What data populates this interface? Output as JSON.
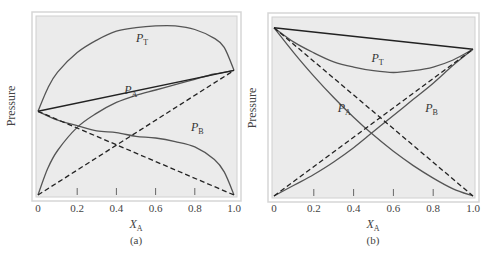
{
  "chart_data": [
    {
      "type": "line",
      "panel": "(a)",
      "title": "",
      "xlabel": "X_A",
      "ylabel": "Pressure",
      "xlim": [
        0,
        1.0
      ],
      "ylim": [
        0,
        1.0
      ],
      "x_ticks": [
        "0",
        "0.2",
        "0.4",
        "0.6",
        "0.8",
        "1.0"
      ],
      "y_ticks": [],
      "grid": false,
      "legend": "inline curve labels",
      "series": [
        {
          "name": "P_T",
          "style": "solid",
          "x": [
            0,
            0.05,
            0.1,
            0.2,
            0.3,
            0.4,
            0.5,
            0.6,
            0.7,
            0.8,
            0.9,
            0.95,
            1.0
          ],
          "values": [
            0.47,
            0.6,
            0.69,
            0.8,
            0.87,
            0.92,
            0.94,
            0.95,
            0.95,
            0.93,
            0.88,
            0.83,
            0.7
          ]
        },
        {
          "name": "P_A",
          "style": "solid",
          "x": [
            0,
            0.05,
            0.1,
            0.2,
            0.3,
            0.4,
            0.5,
            0.6,
            0.7,
            0.8,
            0.9,
            1.0
          ],
          "values": [
            0,
            0.15,
            0.25,
            0.38,
            0.46,
            0.52,
            0.56,
            0.59,
            0.62,
            0.65,
            0.68,
            0.7
          ]
        },
        {
          "name": "P_B",
          "style": "solid",
          "x": [
            0,
            0.1,
            0.2,
            0.3,
            0.4,
            0.5,
            0.6,
            0.7,
            0.8,
            0.9,
            0.95,
            1.0
          ],
          "values": [
            0.47,
            0.42,
            0.39,
            0.36,
            0.35,
            0.33,
            0.32,
            0.3,
            0.27,
            0.2,
            0.13,
            0
          ]
        },
        {
          "name": "Raoult P_T (ideal)",
          "style": "solid-dark",
          "x": [
            0,
            1.0
          ],
          "values": [
            0.47,
            0.7
          ]
        },
        {
          "name": "Raoult P_A (ideal)",
          "style": "dashed",
          "x": [
            0,
            1.0
          ],
          "values": [
            0,
            0.7
          ]
        },
        {
          "name": "Raoult P_B (ideal)",
          "style": "dashed",
          "x": [
            0,
            1.0
          ],
          "values": [
            0.47,
            0
          ]
        }
      ],
      "annotations": [
        {
          "text": "P_T",
          "x": 0.5,
          "y": 0.86
        },
        {
          "text": "P_A",
          "x": 0.44,
          "y": 0.57
        },
        {
          "text": "P_B",
          "x": 0.78,
          "y": 0.36
        }
      ]
    },
    {
      "type": "line",
      "panel": "(b)",
      "title": "",
      "xlabel": "X_A",
      "ylabel": "Pressure",
      "xlim": [
        0,
        1.0
      ],
      "ylim": [
        0,
        1.0
      ],
      "x_ticks": [
        "0",
        "0.2",
        "0.4",
        "0.6",
        "0.8",
        "1.0"
      ],
      "y_ticks": [],
      "grid": false,
      "legend": "inline curve labels",
      "series": [
        {
          "name": "P_T",
          "style": "solid",
          "x": [
            0,
            0.1,
            0.2,
            0.3,
            0.4,
            0.5,
            0.6,
            0.7,
            0.8,
            0.9,
            1.0
          ],
          "values": [
            0.94,
            0.86,
            0.8,
            0.75,
            0.72,
            0.7,
            0.69,
            0.7,
            0.72,
            0.76,
            0.82
          ]
        },
        {
          "name": "P_A",
          "style": "solid",
          "x": [
            0,
            0.1,
            0.2,
            0.3,
            0.4,
            0.5,
            0.6,
            0.7,
            0.8,
            0.9,
            1.0
          ],
          "values": [
            0,
            0.06,
            0.12,
            0.19,
            0.27,
            0.36,
            0.45,
            0.54,
            0.63,
            0.73,
            0.82
          ]
        },
        {
          "name": "P_B",
          "style": "solid",
          "x": [
            0,
            0.1,
            0.2,
            0.3,
            0.4,
            0.5,
            0.6,
            0.7,
            0.8,
            0.9,
            1.0
          ],
          "values": [
            0.94,
            0.8,
            0.67,
            0.55,
            0.44,
            0.34,
            0.25,
            0.17,
            0.1,
            0.04,
            0
          ]
        },
        {
          "name": "Raoult P_T (ideal)",
          "style": "solid-dark",
          "x": [
            0,
            1.0
          ],
          "values": [
            0.94,
            0.82
          ]
        },
        {
          "name": "Raoult P_A (ideal)",
          "style": "dashed",
          "x": [
            0,
            1.0
          ],
          "values": [
            0,
            0.82
          ]
        },
        {
          "name": "Raoult P_B (ideal)",
          "style": "dashed",
          "x": [
            0,
            1.0
          ],
          "values": [
            0.94,
            0
          ]
        }
      ],
      "annotations": [
        {
          "text": "P_T",
          "x": 0.49,
          "y": 0.75
        },
        {
          "text": "P_A",
          "x": 0.32,
          "y": 0.47
        },
        {
          "text": "P_B",
          "x": 0.76,
          "y": 0.47
        }
      ]
    }
  ],
  "panels": [
    {
      "label": "(a)",
      "xlabel_main": "X",
      "xlabel_sub": "A",
      "ylabel": "Pressure",
      "ticks": [
        "0",
        "0.2",
        "0.4",
        "0.6",
        "0.8",
        "1.0"
      ],
      "curve_labels": [
        {
          "main": "P",
          "sub": "T"
        },
        {
          "main": "P",
          "sub": "A"
        },
        {
          "main": "P",
          "sub": "B"
        }
      ]
    },
    {
      "label": "(b)",
      "xlabel_main": "X",
      "xlabel_sub": "A",
      "ylabel": "Pressure",
      "ticks": [
        "0",
        "0.2",
        "0.4",
        "0.6",
        "0.8",
        "1.0"
      ],
      "curve_labels": [
        {
          "main": "P",
          "sub": "T"
        },
        {
          "main": "P",
          "sub": "A"
        },
        {
          "main": "P",
          "sub": "B"
        }
      ]
    }
  ],
  "colors": {
    "plot_bg": "#ebebeb",
    "frame": "#d6d6d6",
    "curve": "#555555",
    "line_dark": "#222222",
    "text": "#444444"
  }
}
